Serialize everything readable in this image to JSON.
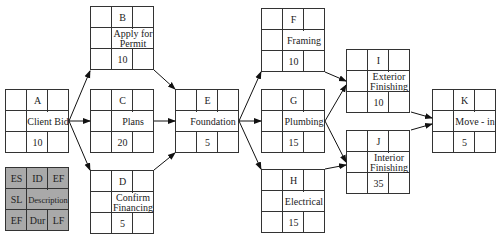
{
  "diagram": {
    "type": "activity-on-node network",
    "nodes": [
      {
        "id": "A",
        "description": "Client Bid",
        "duration": "10"
      },
      {
        "id": "B",
        "description": "Apply for Permit",
        "duration": "10"
      },
      {
        "id": "C",
        "description": "Plans",
        "duration": "20"
      },
      {
        "id": "D",
        "description": "Confirm Financing",
        "duration": "5"
      },
      {
        "id": "E",
        "description": "Foundation",
        "duration": "5"
      },
      {
        "id": "F",
        "description": "Framing",
        "duration": "10"
      },
      {
        "id": "G",
        "description": "Plumbing",
        "duration": "15"
      },
      {
        "id": "H",
        "description": "Electrical",
        "duration": "15"
      },
      {
        "id": "I",
        "description": "Exterior Finishing",
        "duration": "10"
      },
      {
        "id": "J",
        "description": "Interior Finishing",
        "duration": "35"
      },
      {
        "id": "K",
        "description": "Move - in",
        "duration": "5"
      }
    ],
    "edges": [
      [
        "A",
        "B"
      ],
      [
        "A",
        "C"
      ],
      [
        "A",
        "D"
      ],
      [
        "B",
        "E"
      ],
      [
        "C",
        "E"
      ],
      [
        "D",
        "E"
      ],
      [
        "E",
        "F"
      ],
      [
        "E",
        "G"
      ],
      [
        "E",
        "H"
      ],
      [
        "F",
        "I"
      ],
      [
        "G",
        "I"
      ],
      [
        "G",
        "J"
      ],
      [
        "H",
        "J"
      ],
      [
        "I",
        "K"
      ],
      [
        "J",
        "K"
      ]
    ]
  },
  "nodes": {
    "A": {
      "id": "A",
      "line1": "Client Bid",
      "line2": "",
      "dur": "10"
    },
    "B": {
      "id": "B",
      "line1": "Apply for",
      "line2": "Permit",
      "dur": "10"
    },
    "C": {
      "id": "C",
      "line1": "Plans",
      "line2": "",
      "dur": "20"
    },
    "D": {
      "id": "D",
      "line1": "Confirm",
      "line2": "Financing",
      "dur": "5"
    },
    "E": {
      "id": "E",
      "line1": "Foundation",
      "line2": "",
      "dur": "5"
    },
    "F": {
      "id": "F",
      "line1": "Framing",
      "line2": "",
      "dur": "10"
    },
    "G": {
      "id": "G",
      "line1": "Plumbing",
      "line2": "",
      "dur": "15"
    },
    "H": {
      "id": "H",
      "line1": "Electrical",
      "line2": "",
      "dur": "15"
    },
    "I": {
      "id": "I",
      "line1": "Exterior",
      "line2": "Finishing",
      "dur": "10"
    },
    "J": {
      "id": "J",
      "line1": "Interior",
      "line2": "Finishing",
      "dur": "35"
    },
    "K": {
      "id": "K",
      "line1": "Move - in",
      "line2": "",
      "dur": "5"
    }
  },
  "legend": {
    "es": "ES",
    "id": "ID",
    "ef_top": "EF",
    "sl": "SL",
    "description": "Description",
    "ef_bottom": "EF",
    "dur": "Dur",
    "lf": "LF",
    "fill_color": "#a9a9a9"
  }
}
